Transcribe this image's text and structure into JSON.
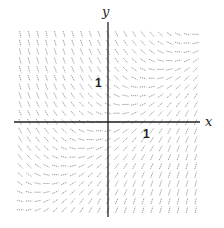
{
  "diagram": {
    "type": "slope-field",
    "equation_slope": "x - y",
    "x_axis_label": "x",
    "y_axis_label": "y",
    "x_tick_label": "1",
    "y_tick_label": "1",
    "x_range": [
      -2.4,
      2.3
    ],
    "y_range": [
      -2.4,
      2.5
    ],
    "grid_count": 21,
    "field_range": [
      -2.25,
      2.25
    ],
    "colors": {
      "axis": "#222222",
      "segment": "#8a8a8a",
      "background": "#ffffff"
    }
  }
}
